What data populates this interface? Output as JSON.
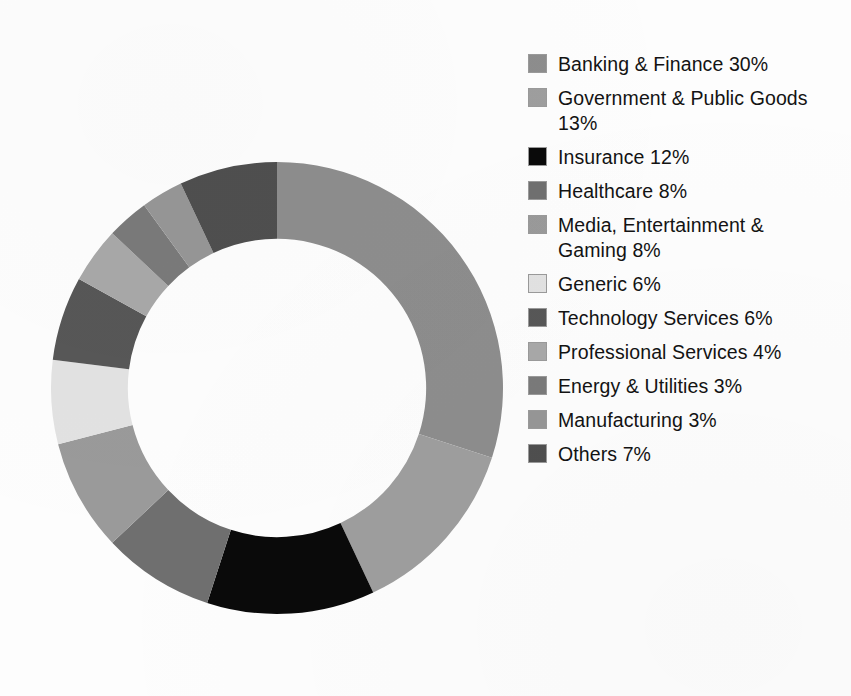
{
  "chart_data": {
    "type": "pie",
    "variant": "donut",
    "title": "",
    "subtitle": "",
    "xlabel": "",
    "ylabel": "",
    "grid": false,
    "legend_position": "right",
    "start_angle_deg": 0,
    "direction": "clockwise",
    "inner_radius_ratio": 0.66,
    "units": "%",
    "total": 100,
    "categories": [
      "Banking & Finance",
      "Government & Public Goods",
      "Insurance",
      "Healthcare",
      "Media, Entertainment & Gaming",
      "Generic",
      "Technology Services",
      "Professional Services",
      "Energy & Utilities",
      "Manufacturing",
      "Others"
    ],
    "values": [
      30,
      13,
      12,
      8,
      8,
      6,
      6,
      4,
      3,
      3,
      7
    ],
    "colors": [
      "#8d8d8d",
      "#9e9e9e",
      "#0a0a0a",
      "#6f6f6f",
      "#9a9a9a",
      "#e2e2e2",
      "#575757",
      "#a8a8a8",
      "#7a7a7a",
      "#969696",
      "#4f4f4f"
    ]
  },
  "legend": {
    "items": [
      {
        "label": "Banking & Finance 30%",
        "color": "#8d8d8d",
        "name": "banking-finance"
      },
      {
        "label": "Government & Public Goods 13%",
        "color": "#9e9e9e",
        "name": "government-public-goods"
      },
      {
        "label": "Insurance 12%",
        "color": "#0a0a0a",
        "name": "insurance"
      },
      {
        "label": "Healthcare 8%",
        "color": "#6f6f6f",
        "name": "healthcare"
      },
      {
        "label": "Media, Entertainment & Gaming 8%",
        "color": "#9a9a9a",
        "name": "media-entertainment-gaming"
      },
      {
        "label": "Generic 6%",
        "color": "#e2e2e2",
        "name": "generic"
      },
      {
        "label": "Technology Services 6%",
        "color": "#575757",
        "name": "technology-services"
      },
      {
        "label": "Professional Services 4%",
        "color": "#a8a8a8",
        "name": "professional-services"
      },
      {
        "label": "Energy & Utilities 3%",
        "color": "#7a7a7a",
        "name": "energy-utilities"
      },
      {
        "label": "Manufacturing 3%",
        "color": "#969696",
        "name": "manufacturing"
      },
      {
        "label": "Others 7%",
        "color": "#4f4f4f",
        "name": "others"
      }
    ]
  }
}
